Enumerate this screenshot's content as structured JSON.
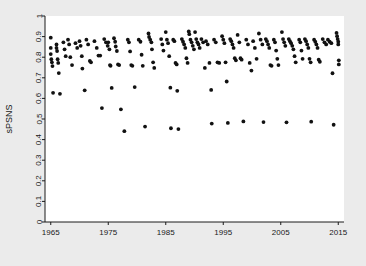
{
  "figure": {
    "background_color": "#ebebeb",
    "plot_background_color": "#ffffff",
    "point_color": "#111111",
    "axis_color": "#1a1a1a"
  },
  "axes": {
    "x_title": "Year",
    "y_title": "sPSNS",
    "x_tick_labels": [
      "1965",
      "1975",
      "1985",
      "1995",
      "2005",
      "2015"
    ],
    "y_tick_labels": [
      "0",
      "0.1",
      "0.2",
      "0.3",
      "0.4",
      "0.5",
      "0.6",
      "0.7",
      "0.8",
      "0.9",
      "1"
    ]
  },
  "chart_data": {
    "type": "scatter",
    "title": "",
    "xlabel": "Year",
    "ylabel": "sPSNS",
    "xlim": [
      1964,
      2016
    ],
    "ylim": [
      0,
      1
    ],
    "xticks": [
      1965,
      1975,
      1985,
      1995,
      2005,
      2015
    ],
    "yticks": [
      0,
      0.1,
      0.2,
      0.3,
      0.4,
      0.5,
      0.6,
      0.7,
      0.8,
      0.9,
      1
    ],
    "grid": false,
    "legend": null,
    "marker": "filled-circle",
    "marker_color": "#111111",
    "series": [
      {
        "name": "sPSNS",
        "points": [
          [
            1965.0,
            0.895
          ],
          [
            1965.0,
            0.845
          ],
          [
            1965.0,
            0.815
          ],
          [
            1965.1,
            0.79
          ],
          [
            1965.2,
            0.775
          ],
          [
            1965.3,
            0.757
          ],
          [
            1965.4,
            0.627
          ],
          [
            1966.0,
            0.862
          ],
          [
            1966.0,
            0.845
          ],
          [
            1966.1,
            0.83
          ],
          [
            1966.2,
            0.79
          ],
          [
            1966.3,
            0.772
          ],
          [
            1966.4,
            0.723
          ],
          [
            1966.6,
            0.622
          ],
          [
            1967.2,
            0.872
          ],
          [
            1967.4,
            0.838
          ],
          [
            1967.6,
            0.805
          ],
          [
            1968.0,
            0.885
          ],
          [
            1968.2,
            0.862
          ],
          [
            1968.4,
            0.8
          ],
          [
            1968.7,
            0.762
          ],
          [
            1969.3,
            0.868
          ],
          [
            1969.6,
            0.845
          ],
          [
            1970.0,
            0.878
          ],
          [
            1970.2,
            0.855
          ],
          [
            1970.4,
            0.805
          ],
          [
            1970.5,
            0.745
          ],
          [
            1970.9,
            0.639
          ],
          [
            1971.2,
            0.885
          ],
          [
            1971.5,
            0.862
          ],
          [
            1971.8,
            0.782
          ],
          [
            1972.0,
            0.775
          ],
          [
            1972.6,
            0.878
          ],
          [
            1973.0,
            0.845
          ],
          [
            1973.3,
            0.808
          ],
          [
            1973.6,
            0.808
          ],
          [
            1973.9,
            0.553
          ],
          [
            1974.3,
            0.888
          ],
          [
            1974.6,
            0.872
          ],
          [
            1974.9,
            0.855
          ],
          [
            1975.0,
            0.872
          ],
          [
            1975.2,
            0.838
          ],
          [
            1975.3,
            0.762
          ],
          [
            1975.4,
            0.758
          ],
          [
            1975.6,
            0.651
          ],
          [
            1976.0,
            0.892
          ],
          [
            1976.2,
            0.875
          ],
          [
            1976.3,
            0.852
          ],
          [
            1976.5,
            0.83
          ],
          [
            1976.7,
            0.765
          ],
          [
            1976.9,
            0.762
          ],
          [
            1977.2,
            0.547
          ],
          [
            1977.8,
            0.441
          ],
          [
            1978.4,
            0.885
          ],
          [
            1978.6,
            0.872
          ],
          [
            1978.8,
            0.828
          ],
          [
            1979.0,
            0.762
          ],
          [
            1979.2,
            0.758
          ],
          [
            1979.6,
            0.655
          ],
          [
            1980.3,
            0.885
          ],
          [
            1980.6,
            0.875
          ],
          [
            1980.8,
            0.812
          ],
          [
            1981.0,
            0.758
          ],
          [
            1981.4,
            0.463
          ],
          [
            1982.0,
            0.915
          ],
          [
            1982.1,
            0.898
          ],
          [
            1982.3,
            0.885
          ],
          [
            1982.5,
            0.872
          ],
          [
            1982.6,
            0.838
          ],
          [
            1982.8,
            0.775
          ],
          [
            1983.0,
            0.748
          ],
          [
            1984.2,
            0.888
          ],
          [
            1984.4,
            0.862
          ],
          [
            1984.6,
            0.832
          ],
          [
            1985.0,
            0.922
          ],
          [
            1985.2,
            0.885
          ],
          [
            1985.4,
            0.868
          ],
          [
            1985.6,
            0.805
          ],
          [
            1985.8,
            0.652
          ],
          [
            1985.9,
            0.455
          ],
          [
            1986.3,
            0.885
          ],
          [
            1986.5,
            0.878
          ],
          [
            1986.7,
            0.772
          ],
          [
            1986.9,
            0.765
          ],
          [
            1987.0,
            0.637
          ],
          [
            1987.2,
            0.451
          ],
          [
            1987.8,
            0.888
          ],
          [
            1988.0,
            0.875
          ],
          [
            1988.2,
            0.862
          ],
          [
            1988.4,
            0.845
          ],
          [
            1988.6,
            0.795
          ],
          [
            1988.8,
            0.772
          ],
          [
            1989.0,
            0.925
          ],
          [
            1989.1,
            0.912
          ],
          [
            1989.3,
            0.885
          ],
          [
            1989.5,
            0.872
          ],
          [
            1989.7,
            0.855
          ],
          [
            1989.9,
            0.838
          ],
          [
            1990.1,
            0.922
          ],
          [
            1990.3,
            0.888
          ],
          [
            1990.5,
            0.872
          ],
          [
            1990.7,
            0.862
          ],
          [
            1990.9,
            0.845
          ],
          [
            1991.2,
            0.888
          ],
          [
            1991.5,
            0.872
          ],
          [
            1991.8,
            0.748
          ],
          [
            1992.0,
            0.878
          ],
          [
            1992.3,
            0.862
          ],
          [
            1992.6,
            0.772
          ],
          [
            1992.9,
            0.641
          ],
          [
            1993.0,
            0.478
          ],
          [
            1993.4,
            0.885
          ],
          [
            1993.7,
            0.872
          ],
          [
            1994.0,
            0.775
          ],
          [
            1994.3,
            0.772
          ],
          [
            1994.8,
            0.902
          ],
          [
            1995.0,
            0.885
          ],
          [
            1995.2,
            0.868
          ],
          [
            1995.4,
            0.775
          ],
          [
            1995.6,
            0.682
          ],
          [
            1995.8,
            0.481
          ],
          [
            1996.2,
            0.888
          ],
          [
            1996.4,
            0.878
          ],
          [
            1996.6,
            0.862
          ],
          [
            1996.8,
            0.845
          ],
          [
            1997.0,
            0.795
          ],
          [
            1997.2,
            0.785
          ],
          [
            1997.5,
            0.908
          ],
          [
            1997.8,
            0.872
          ],
          [
            1998.0,
            0.795
          ],
          [
            1998.2,
            0.788
          ],
          [
            1998.5,
            0.488
          ],
          [
            1999.0,
            0.885
          ],
          [
            1999.3,
            0.862
          ],
          [
            1999.6,
            0.772
          ],
          [
            1999.9,
            0.735
          ],
          [
            2000.2,
            0.878
          ],
          [
            2000.5,
            0.845
          ],
          [
            2000.8,
            0.792
          ],
          [
            2001.2,
            0.915
          ],
          [
            2001.5,
            0.885
          ],
          [
            2001.8,
            0.862
          ],
          [
            2002.0,
            0.485
          ],
          [
            2002.4,
            0.888
          ],
          [
            2002.6,
            0.878
          ],
          [
            2002.8,
            0.862
          ],
          [
            2003.0,
            0.845
          ],
          [
            2003.2,
            0.762
          ],
          [
            2003.4,
            0.758
          ],
          [
            2003.8,
            0.885
          ],
          [
            2004.0,
            0.872
          ],
          [
            2004.2,
            0.832
          ],
          [
            2004.4,
            0.792
          ],
          [
            2004.6,
            0.762
          ],
          [
            2005.2,
            0.922
          ],
          [
            2005.4,
            0.888
          ],
          [
            2005.6,
            0.872
          ],
          [
            2005.8,
            0.855
          ],
          [
            2006.0,
            0.484
          ],
          [
            2006.4,
            0.888
          ],
          [
            2006.6,
            0.878
          ],
          [
            2006.8,
            0.868
          ],
          [
            2007.0,
            0.855
          ],
          [
            2007.2,
            0.838
          ],
          [
            2007.4,
            0.805
          ],
          [
            2007.6,
            0.775
          ],
          [
            2008.2,
            0.885
          ],
          [
            2008.4,
            0.872
          ],
          [
            2008.6,
            0.832
          ],
          [
            2008.8,
            0.792
          ],
          [
            2009.2,
            0.888
          ],
          [
            2009.4,
            0.878
          ],
          [
            2009.6,
            0.862
          ],
          [
            2009.8,
            0.845
          ],
          [
            2010.0,
            0.792
          ],
          [
            2010.2,
            0.775
          ],
          [
            2010.3,
            0.487
          ],
          [
            2010.8,
            0.885
          ],
          [
            2011.0,
            0.875
          ],
          [
            2011.2,
            0.862
          ],
          [
            2011.4,
            0.845
          ],
          [
            2011.6,
            0.788
          ],
          [
            2011.8,
            0.778
          ],
          [
            2012.3,
            0.888
          ],
          [
            2012.6,
            0.872
          ],
          [
            2012.9,
            0.862
          ],
          [
            2013.2,
            0.885
          ],
          [
            2013.5,
            0.875
          ],
          [
            2013.8,
            0.868
          ],
          [
            2014.0,
            0.722
          ],
          [
            2014.2,
            0.472
          ],
          [
            2014.7,
            0.918
          ],
          [
            2014.8,
            0.902
          ],
          [
            2014.9,
            0.888
          ],
          [
            2015.0,
            0.875
          ],
          [
            2015.0,
            0.862
          ],
          [
            2015.1,
            0.785
          ],
          [
            2015.1,
            0.765
          ]
        ]
      }
    ]
  }
}
